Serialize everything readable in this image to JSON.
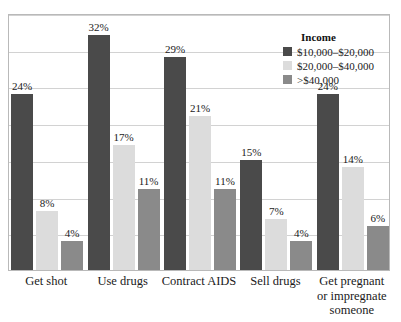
{
  "chart_data": {
    "type": "bar",
    "title": "",
    "subtitle": "",
    "xlabel": "",
    "ylabel": "",
    "ylim": [
      0,
      35
    ],
    "grid": true,
    "grid_step": 5,
    "legend_position": "top-right-inside",
    "legend_title": "Income",
    "categories": [
      "Get shot",
      "Use drugs",
      "Contract AIDS",
      "Sell drugs",
      "Get pregnant or impregnate someone"
    ],
    "category_lines": [
      [
        "Get shot"
      ],
      [
        "Use drugs"
      ],
      [
        "Contract AIDS"
      ],
      [
        "Sell drugs"
      ],
      [
        "Get pregnant",
        "or impregnate",
        "someone"
      ]
    ],
    "series": [
      {
        "name": "$10,000–$20,000",
        "color": "#4a4a4a",
        "values": [
          24,
          32,
          29,
          15,
          24
        ],
        "labels": [
          "24%",
          "32%",
          "29%",
          "15%",
          "24%"
        ]
      },
      {
        "name": "$20,000–$40,000",
        "color": "#dcdcdc",
        "values": [
          8,
          17,
          21,
          7,
          14
        ],
        "labels": [
          "8%",
          "17%",
          "21%",
          "7%",
          "14%"
        ]
      },
      {
        "name": ">$40,000",
        "color": "#8a8a8a",
        "values": [
          4,
          11,
          11,
          4,
          6
        ],
        "labels": [
          "4%",
          "11%",
          "11%",
          "4%",
          "6%"
        ]
      }
    ]
  },
  "colors": {
    "series_dark": "#4a4a4a",
    "series_light": "#dcdcdc",
    "series_medium": "#8a8a8a",
    "gridline": "#d2d2d2",
    "plot_border": "#b9b9b9",
    "background": "#ffffff",
    "text": "#1a1a1a"
  }
}
